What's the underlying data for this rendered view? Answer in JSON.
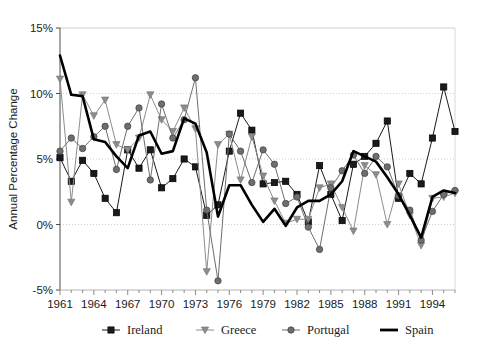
{
  "chart_data": {
    "type": "line",
    "title": "",
    "xlabel": "",
    "ylabel": "Annual Percentage Change",
    "xlim": [
      1961,
      1996
    ],
    "ylim": [
      -5,
      15
    ],
    "ytick_labels": [
      "15%",
      "10%",
      "5%",
      "0%",
      "-5%"
    ],
    "ytick_values": [
      15,
      10,
      5,
      0,
      -5
    ],
    "xtick_labels": [
      "1961",
      "1964",
      "1967",
      "1970",
      "1973",
      "1976",
      "1979",
      "1982",
      "1985",
      "1988",
      "1991",
      "1994"
    ],
    "xtick_values": [
      1961,
      1964,
      1967,
      1970,
      1973,
      1976,
      1979,
      1982,
      1985,
      1988,
      1991,
      1994
    ],
    "grid": "horizontal-dotted",
    "legend_position": "bottom",
    "x": [
      1961,
      1962,
      1963,
      1964,
      1965,
      1966,
      1967,
      1968,
      1969,
      1970,
      1971,
      1972,
      1973,
      1974,
      1975,
      1976,
      1977,
      1978,
      1979,
      1980,
      1981,
      1982,
      1983,
      1984,
      1985,
      1986,
      1987,
      1988,
      1989,
      1990,
      1991,
      1992,
      1993,
      1994,
      1995,
      1996
    ],
    "series": [
      {
        "name": "Ireland",
        "color": "#1a1a1a",
        "marker": "square",
        "line_width": 1,
        "values": [
          5.1,
          3.3,
          4.9,
          3.9,
          2.0,
          0.9,
          5.7,
          4.3,
          5.7,
          2.8,
          3.5,
          5.0,
          4.4,
          0.7,
          1.5,
          5.6,
          8.5,
          7.2,
          3.1,
          3.2,
          3.3,
          2.3,
          0.2,
          4.5,
          2.3,
          0.3,
          4.6,
          5.2,
          6.2,
          7.9,
          2.0,
          3.9,
          3.1,
          6.6,
          10.5,
          7.1
        ]
      },
      {
        "name": "Greece",
        "color": "#8c8c8c",
        "marker": "triangle-down",
        "line_width": 1,
        "values": [
          11.1,
          1.7,
          9.9,
          8.3,
          9.5,
          6.1,
          5.7,
          6.6,
          9.9,
          8.0,
          7.1,
          8.9,
          7.3,
          -3.6,
          6.1,
          6.9,
          3.4,
          6.7,
          3.7,
          1.8,
          0.1,
          0.4,
          0.4,
          2.8,
          3.1,
          1.3,
          -0.5,
          4.5,
          3.8,
          0.0,
          3.1,
          0.7,
          -1.6,
          2.0,
          2.1,
          2.4
        ]
      },
      {
        "name": "Portugal",
        "color": "#6e6e6e",
        "marker": "circle",
        "line_width": 1,
        "values": [
          5.6,
          6.6,
          5.8,
          6.7,
          7.5,
          4.2,
          7.5,
          8.9,
          3.4,
          9.2,
          6.6,
          8.0,
          11.2,
          1.1,
          -4.3,
          6.9,
          5.6,
          3.2,
          5.7,
          4.6,
          1.6,
          2.1,
          -0.2,
          -1.9,
          2.8,
          4.1,
          5.3,
          3.9,
          5.2,
          4.4,
          2.2,
          1.1,
          -1.2,
          1.0,
          2.3,
          2.6
        ]
      },
      {
        "name": "Spain",
        "color": "#000000",
        "marker": "none",
        "line_width": 2.6,
        "values": [
          12.9,
          9.9,
          9.8,
          6.5,
          6.3,
          5.2,
          4.3,
          6.8,
          7.1,
          5.4,
          5.6,
          8.1,
          7.7,
          5.5,
          0.6,
          3.0,
          3.0,
          1.5,
          0.2,
          1.2,
          -0.1,
          1.3,
          1.8,
          1.8,
          2.3,
          3.3,
          5.6,
          5.2,
          4.8,
          3.6,
          2.3,
          0.7,
          -1.0,
          2.1,
          2.6,
          2.4
        ]
      }
    ]
  },
  "legend": {
    "items": [
      {
        "label": "Ireland"
      },
      {
        "label": "Greece"
      },
      {
        "label": "Portugal"
      },
      {
        "label": "Spain"
      }
    ]
  }
}
